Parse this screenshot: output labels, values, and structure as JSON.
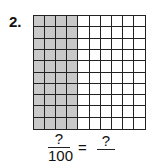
{
  "problem": {
    "number": "2.",
    "grid": {
      "rows": 10,
      "cols": 10,
      "shaded_columns": 4,
      "shade_color": "#c9c9c9"
    },
    "fraction": {
      "numerator": "?",
      "denominator": "100"
    },
    "equals": "=",
    "answer": "?"
  }
}
